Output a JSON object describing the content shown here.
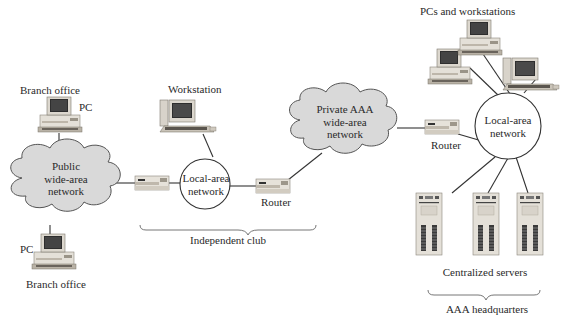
{
  "diagram": {
    "type": "network-topology",
    "colors": {
      "cloud_fill": "#d9d9d9",
      "cloud_stroke": "#555555",
      "device_body": "#e6e2da",
      "device_stripe": "#c9c2b6",
      "screen": "#2a2a2a",
      "link": "#333333"
    },
    "branch_offices": [
      {
        "location_label": "Branch office",
        "device_label": "PC",
        "position": "top"
      },
      {
        "location_label": "Branch office",
        "device_label": "PC",
        "position": "bottom"
      }
    ],
    "public_wan": {
      "lines": [
        "Public",
        "wide-area",
        "network"
      ]
    },
    "independent_club": {
      "workstation_label": "Workstation",
      "lan_lines": [
        "Local-area",
        "network"
      ],
      "router_label": "Router",
      "group_label": "Independent club"
    },
    "private_wan": {
      "lines": [
        "Private AAA",
        "wide-area",
        "network"
      ]
    },
    "headquarters": {
      "pcs_label": "PCs and workstations",
      "router_label": "Router",
      "lan_lines": [
        "Local-area",
        "network"
      ],
      "servers_label": "Centralized servers",
      "server_count": 3,
      "group_label": "AAA headquarters"
    }
  }
}
